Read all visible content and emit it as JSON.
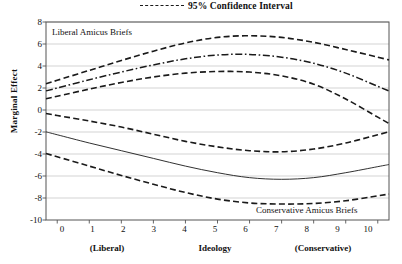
{
  "legend": {
    "label": "95% Confidence Interval",
    "marker": "dashed-line-icon"
  },
  "axes": {
    "ylabel": "Marginal Effect",
    "xlabel_center": "Ideology",
    "xlabel_left": "(Liberal)",
    "xlabel_right": "(Conservative)",
    "yticks": [
      "8",
      "6",
      "4",
      "2",
      "0",
      "-2",
      "-4",
      "-6",
      "-8",
      "-10"
    ],
    "xticks": [
      "0",
      "1",
      "2",
      "3",
      "4",
      "5",
      "6",
      "7",
      "8",
      "9",
      "10"
    ]
  },
  "annotations": {
    "upper": "Liberal Amicus Briefs",
    "lower": "Conservative Amicus Briefs"
  },
  "colors": {
    "line": "#1a1a1a",
    "grid": "#c8c8c8",
    "frame": "#555555",
    "background": "#ffffff"
  },
  "chart_data": {
    "type": "line",
    "title": "",
    "xlabel": "Ideology",
    "ylabel": "Marginal Effect",
    "xlim": [
      -0.35,
      10.35
    ],
    "ylim": [
      -10,
      8
    ],
    "grid": true,
    "legend_position": "top-center",
    "x": [
      0,
      1,
      2,
      3,
      4,
      5,
      6,
      7,
      8,
      9,
      10
    ],
    "series": [
      {
        "name": "Liberal Amicus Briefs",
        "style": "dash-dot",
        "role": "estimate",
        "values": [
          2.0,
          2.75,
          3.45,
          4.1,
          4.65,
          5.0,
          5.05,
          4.8,
          4.25,
          3.35,
          2.15
        ]
      },
      {
        "name": "Liberal Amicus Briefs 95% CI upper",
        "style": "dashed",
        "role": "ci-upper",
        "values": [
          2.7,
          3.6,
          4.5,
          5.35,
          6.1,
          6.6,
          6.75,
          6.6,
          6.15,
          5.5,
          4.8
        ]
      },
      {
        "name": "Liberal Amicus Briefs 95% CI lower",
        "style": "dashed",
        "role": "ci-lower",
        "values": [
          1.25,
          1.9,
          2.5,
          3.0,
          3.35,
          3.5,
          3.45,
          3.1,
          2.35,
          1.0,
          -0.65
        ]
      },
      {
        "name": "Conservative Amicus Briefs",
        "style": "solid",
        "role": "estimate",
        "values": [
          -2.25,
          -3.0,
          -3.7,
          -4.4,
          -5.1,
          -5.7,
          -6.15,
          -6.3,
          -6.15,
          -5.7,
          -5.15
        ]
      },
      {
        "name": "Conservative Amicus Briefs 95% CI upper",
        "style": "dashed",
        "role": "ci-upper",
        "values": [
          -0.5,
          -1.0,
          -1.55,
          -2.2,
          -2.85,
          -3.35,
          -3.7,
          -3.8,
          -3.55,
          -3.0,
          -2.25
        ]
      },
      {
        "name": "Conservative Amicus Briefs 95% CI lower",
        "style": "dashed",
        "role": "ci-lower",
        "values": [
          -4.25,
          -5.1,
          -5.95,
          -6.75,
          -7.5,
          -8.1,
          -8.45,
          -8.55,
          -8.5,
          -8.25,
          -7.8
        ]
      }
    ]
  }
}
